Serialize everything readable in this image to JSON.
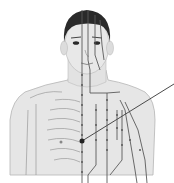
{
  "figure": {
    "caption": "",
    "colors": {
      "background": "#ffffff",
      "skin": "#e6e6e6",
      "skin_shadow": "#c9c9c9",
      "hair": "#2a2a2a",
      "meridian_line": "#5a5a5a",
      "bone_outline": "#9a9a9a",
      "pointer_line": "#4a4a4a",
      "marked_point": "#222222"
    },
    "pointer": {
      "from": [
        82,
        141
      ],
      "to": [
        174,
        84
      ]
    }
  }
}
